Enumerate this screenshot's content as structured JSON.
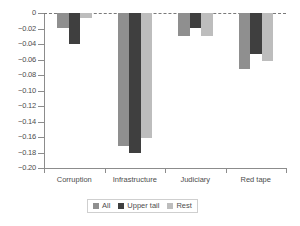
{
  "chart_data": {
    "type": "bar",
    "title": "",
    "subtitle": "",
    "xlabel": "",
    "ylabel": "",
    "categories": [
      "Corruption",
      "Infrastructure",
      "Judiciary",
      "Red tape"
    ],
    "series": [
      {
        "name": "All",
        "color": "#8f8f8f",
        "values": [
          -0.019,
          -0.171,
          -0.03,
          -0.072
        ]
      },
      {
        "name": "Upper tail",
        "color": "#3f3f3f",
        "values": [
          -0.04,
          -0.181,
          -0.019,
          -0.053
        ]
      },
      {
        "name": "Rest",
        "color": "#bdbdbd",
        "values": [
          -0.007,
          -0.161,
          -0.03,
          -0.062
        ]
      }
    ],
    "ylim": [
      -0.2,
      0
    ],
    "ytick_values": [
      0,
      -0.02,
      -0.04,
      -0.06,
      -0.08,
      -0.1,
      -0.12,
      -0.14,
      -0.16,
      -0.18,
      -0.2
    ],
    "ytick_labels": [
      "0",
      "-0.02",
      "-0.04",
      "-0.06",
      "-0.08",
      "-0.10",
      "-0.12",
      "-0.14",
      "-0.16",
      "-0.18",
      "-0.20"
    ],
    "grid": false,
    "zero_line": "dashed",
    "legend_position": "bottom",
    "legend_entries": [
      "All",
      "Upper tail",
      "Rest"
    ]
  }
}
